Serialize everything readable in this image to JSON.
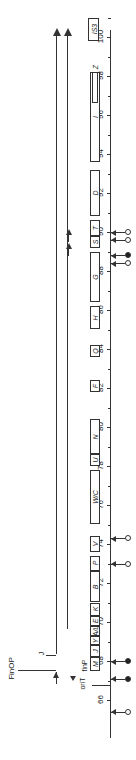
{
  "chart_data": {
    "type": "genetic_map",
    "orientation": "rotated-90",
    "axis": {
      "min": 65,
      "max": 101,
      "tick_labels": [
        "66",
        "68",
        "70",
        "72",
        "74",
        "76",
        "78",
        "80",
        "82",
        "84",
        "86",
        "88",
        "90",
        "92",
        "94",
        "96",
        "98",
        "100"
      ]
    },
    "genes": [
      {
        "label": "M",
        "start": 67.5,
        "end": 68.2
      },
      {
        "label": "J",
        "start": 68.2,
        "end": 68.8
      },
      {
        "label": "Y",
        "start": 68.8,
        "end": 69.3
      },
      {
        "label": "A/L",
        "start": 69.3,
        "end": 69.8
      },
      {
        "label": "E",
        "start": 69.8,
        "end": 70.3
      },
      {
        "label": "K",
        "start": 70.3,
        "end": 71.0
      },
      {
        "label": "B",
        "start": 71.0,
        "end": 72.6
      },
      {
        "label": "P",
        "start": 72.6,
        "end": 73.4
      },
      {
        "label": "V",
        "start": 73.6,
        "end": 74.4
      },
      {
        "label": "W/C",
        "start": 75.0,
        "end": 77.8
      },
      {
        "label": "U",
        "start": 78.0,
        "end": 78.6
      },
      {
        "label": "N",
        "start": 78.6,
        "end": 80.4
      },
      {
        "label": "F",
        "start": 81.8,
        "end": 82.4
      },
      {
        "label": "Q",
        "start": 83.6,
        "end": 84.2
      },
      {
        "label": "H",
        "start": 85.0,
        "end": 86.2
      },
      {
        "label": "G",
        "start": 86.4,
        "end": 89.0
      },
      {
        "label": "S",
        "start": 89.2,
        "end": 89.8
      },
      {
        "label": "T",
        "start": 89.8,
        "end": 90.6
      },
      {
        "label": "D",
        "start": 90.8,
        "end": 93.2
      },
      {
        "label": "I",
        "start": 93.6,
        "end": 98.2
      },
      {
        "label": "Z",
        "start": 96.6,
        "end": 98.2
      },
      {
        "label": "IS3",
        "start": 99.8,
        "end": 101.0
      }
    ],
    "annotations": [
      "oriT",
      "finP",
      "FinOP",
      "J"
    ],
    "markers": [
      {
        "position": 65.4,
        "type": "open"
      },
      {
        "position": 67.1,
        "type": "filled"
      },
      {
        "position": 68.0,
        "type": "filled"
      },
      {
        "position": 73.0,
        "type": "open"
      },
      {
        "position": 74.3,
        "type": "open"
      },
      {
        "position": 88.4,
        "type": "open"
      },
      {
        "position": 88.8,
        "type": "filled"
      },
      {
        "position": 89.6,
        "type": "open"
      },
      {
        "position": 90.0,
        "type": "open"
      }
    ],
    "transcripts": [
      {
        "from": 67.5,
        "to": 101,
        "direction": "up"
      },
      {
        "from": 69.0,
        "to": 101,
        "direction": "up"
      },
      {
        "from": 94.5,
        "to": 99.8,
        "direction": "none"
      }
    ]
  },
  "labels": {
    "finop": "FinOP",
    "j": "J",
    "orit": "oriT",
    "finp": "finP"
  }
}
